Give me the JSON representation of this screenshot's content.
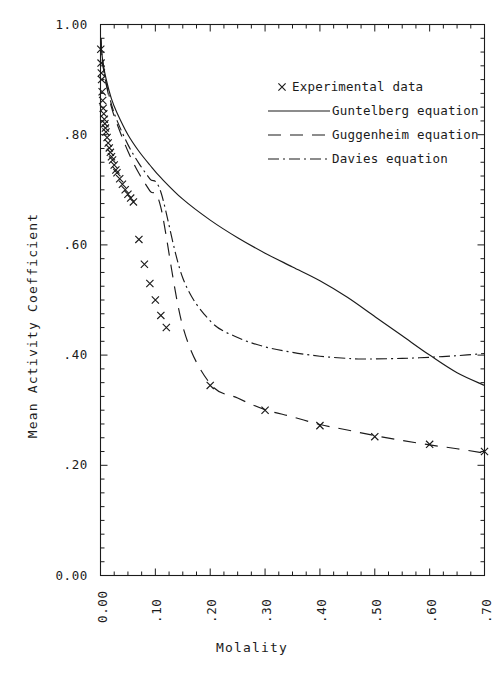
{
  "chart_data": {
    "type": "line",
    "title": "",
    "xlabel": "Molality",
    "ylabel": "Mean Activity Coefficient",
    "xlim": [
      0.0,
      0.7
    ],
    "ylim": [
      0.0,
      1.0
    ],
    "grid": false,
    "legend_position": "upper-right-inside",
    "xticks": [
      0.0,
      0.1,
      0.2,
      0.3,
      0.4,
      0.5,
      0.6,
      0.7
    ],
    "xtick_labels": [
      "0.00",
      ".10",
      ".20",
      ".30",
      ".40",
      ".50",
      ".60",
      ".70"
    ],
    "x_minor_tick_step": 0.025,
    "yticks": [
      0.0,
      0.2,
      0.4,
      0.6,
      0.8,
      1.0
    ],
    "ytick_labels": [
      "0.00",
      ".20",
      ".40",
      ".60",
      ".80",
      "1.00"
    ],
    "y_minor_tick_step": 0.025,
    "legend": [
      {
        "name": "Experimental data",
        "style": "marker",
        "marker": "x"
      },
      {
        "name": "Guntelberg equation",
        "style": "solid"
      },
      {
        "name": "Guggenheim equation",
        "style": "long-dash"
      },
      {
        "name": "Davies equation",
        "style": "dash-dot"
      }
    ],
    "series": [
      {
        "name": "Experimental data",
        "style": "scatter",
        "marker": "x",
        "x": [
          0.0005,
          0.001,
          0.0015,
          0.002,
          0.003,
          0.004,
          0.005,
          0.006,
          0.007,
          0.008,
          0.009,
          0.01,
          0.012,
          0.014,
          0.016,
          0.018,
          0.02,
          0.022,
          0.025,
          0.028,
          0.03,
          0.035,
          0.04,
          0.045,
          0.05,
          0.055,
          0.06,
          0.07,
          0.08,
          0.09,
          0.1,
          0.11,
          0.12,
          0.2,
          0.3,
          0.4,
          0.5,
          0.6,
          0.7
        ],
        "y": [
          0.955,
          0.93,
          0.912,
          0.9,
          0.878,
          0.862,
          0.848,
          0.838,
          0.828,
          0.82,
          0.812,
          0.805,
          0.795,
          0.785,
          0.776,
          0.768,
          0.76,
          0.754,
          0.745,
          0.736,
          0.731,
          0.72,
          0.71,
          0.7,
          0.692,
          0.685,
          0.678,
          0.61,
          0.565,
          0.53,
          0.5,
          0.472,
          0.45,
          0.345,
          0.3,
          0.272,
          0.252,
          0.238,
          0.225
        ]
      },
      {
        "name": "Guntelberg equation",
        "style": "solid",
        "x": [
          0.0005,
          0.002,
          0.005,
          0.01,
          0.02,
          0.03,
          0.05,
          0.07,
          0.09,
          0.11,
          0.15,
          0.2,
          0.25,
          0.3,
          0.35,
          0.4,
          0.45,
          0.5,
          0.55,
          0.6,
          0.65,
          0.7
        ],
        "y": [
          0.975,
          0.952,
          0.928,
          0.902,
          0.865,
          0.84,
          0.8,
          0.77,
          0.745,
          0.722,
          0.683,
          0.645,
          0.613,
          0.585,
          0.56,
          0.535,
          0.505,
          0.47,
          0.435,
          0.4,
          0.368,
          0.345
        ]
      },
      {
        "name": "Guggenheim equation",
        "style": "long-dash",
        "x": [
          0.0005,
          0.002,
          0.005,
          0.01,
          0.02,
          0.03,
          0.05,
          0.07,
          0.09,
          0.11,
          0.15,
          0.2,
          0.25,
          0.3,
          0.35,
          0.4,
          0.45,
          0.5,
          0.55,
          0.6,
          0.65,
          0.7
        ],
        "y": [
          0.975,
          0.95,
          0.923,
          0.893,
          0.85,
          0.82,
          0.77,
          0.73,
          0.698,
          0.668,
          0.452,
          0.348,
          0.322,
          0.301,
          0.288,
          0.274,
          0.264,
          0.254,
          0.245,
          0.237,
          0.23,
          0.222
        ]
      },
      {
        "name": "Davies equation",
        "style": "dash-dot",
        "x": [
          0.0005,
          0.002,
          0.005,
          0.01,
          0.02,
          0.03,
          0.05,
          0.07,
          0.09,
          0.11,
          0.15,
          0.2,
          0.25,
          0.3,
          0.35,
          0.4,
          0.45,
          0.47,
          0.5,
          0.55,
          0.6,
          0.65,
          0.7
        ],
        "y": [
          0.975,
          0.95,
          0.923,
          0.895,
          0.855,
          0.826,
          0.782,
          0.748,
          0.72,
          0.696,
          0.54,
          0.462,
          0.432,
          0.415,
          0.405,
          0.398,
          0.394,
          0.393,
          0.393,
          0.394,
          0.396,
          0.399,
          0.403
        ]
      }
    ]
  }
}
